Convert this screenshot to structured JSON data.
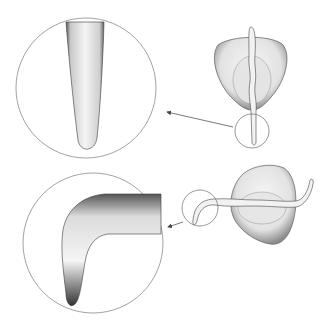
{
  "figure": {
    "colors": {
      "background": "#ffffff",
      "line": "#6b6b6b",
      "ink": "#2a2a2a",
      "shade": "#9a9a9a",
      "fill": "#f3f3f3"
    },
    "panels": [
      {
        "name": "vertical-root",
        "seed_center": [
          250,
          75
        ],
        "small_circle": {
          "cx": 252,
          "cy": 131,
          "r": 17
        },
        "large_circle": {
          "cx": 86,
          "cy": 88,
          "r": 70
        },
        "arrow": {
          "from": [
            233,
            127
          ],
          "to": [
            166,
            112
          ]
        }
      },
      {
        "name": "bent-root",
        "seed_center": [
          265,
          205
        ],
        "small_circle": {
          "cx": 200,
          "cy": 202,
          "r": 18
        },
        "large_circle": {
          "cx": 93,
          "cy": 243,
          "r": 70
        },
        "arrow": {
          "from": [
            183,
            222
          ],
          "to": [
            167,
            227
          ]
        }
      }
    ]
  }
}
